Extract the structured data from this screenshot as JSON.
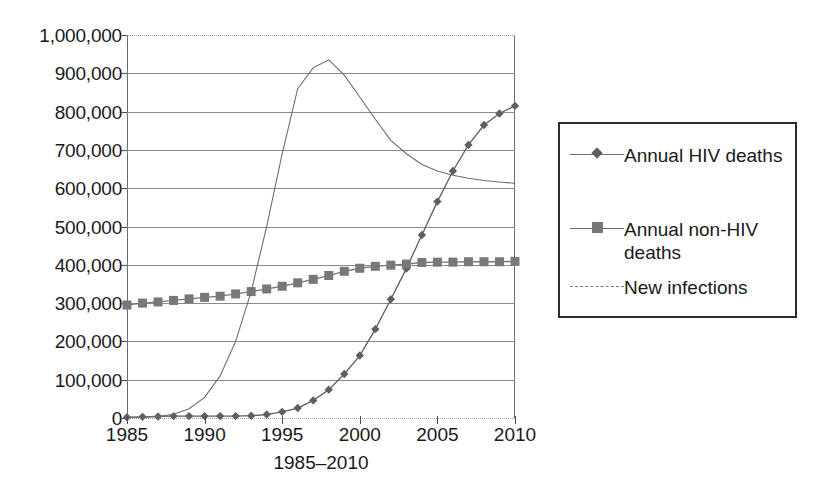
{
  "chart_data": {
    "type": "line",
    "title": "",
    "xlabel": "1985–2010",
    "ylabel": "",
    "xlim": [
      1985,
      2010
    ],
    "ylim": [
      0,
      1000000
    ],
    "grid": true,
    "legend_position": "right",
    "x": [
      1985,
      1986,
      1987,
      1988,
      1989,
      1990,
      1991,
      1992,
      1993,
      1994,
      1995,
      1996,
      1997,
      1998,
      1999,
      2000,
      2001,
      2002,
      2003,
      2004,
      2005,
      2006,
      2007,
      2008,
      2009,
      2010
    ],
    "xtick_labels": [
      "1985",
      "1990",
      "1995",
      "2000",
      "2005",
      "2010"
    ],
    "xticks": [
      1985,
      1990,
      1995,
      2000,
      2005,
      2010
    ],
    "ytick_labels": [
      "0",
      "100,000",
      "200,000",
      "300,000",
      "400,000",
      "500,000",
      "600,000",
      "700,000",
      "800,000",
      "900,000",
      "1,000,000"
    ],
    "yticks": [
      0,
      100000,
      200000,
      300000,
      400000,
      500000,
      600000,
      700000,
      800000,
      900000,
      1000000
    ],
    "series": [
      {
        "name": "Annual HIV deaths",
        "marker": "diamond",
        "color": "#5f5f5f",
        "values": [
          2000,
          3000,
          4000,
          5000,
          5000,
          5000,
          5000,
          5000,
          6000,
          9000,
          16000,
          26000,
          46000,
          74000,
          115000,
          163000,
          232000,
          310000,
          390000,
          478000,
          565000,
          645000,
          713000,
          765000,
          795000,
          815000
        ]
      },
      {
        "name": "Annual non-HIV deaths",
        "marker": "square",
        "color": "#787878",
        "values": [
          295000,
          300000,
          303000,
          307000,
          311000,
          315000,
          318000,
          324000,
          330000,
          337000,
          344000,
          353000,
          362000,
          372000,
          383000,
          391000,
          396000,
          399000,
          402000,
          406000,
          407000,
          407000,
          408000,
          408000,
          408000,
          409000
        ]
      },
      {
        "name": "New infections",
        "marker": "none",
        "color": "#6e6e6e",
        "values": [
          500,
          1500,
          4000,
          10000,
          24000,
          54000,
          110000,
          200000,
          330000,
          500000,
          690000,
          860000,
          915000,
          935000,
          895000,
          838000,
          780000,
          725000,
          690000,
          662000,
          645000,
          634000,
          626000,
          620000,
          616000,
          613000
        ]
      }
    ]
  },
  "legend": {
    "items": [
      {
        "label": "Annual HIV deaths",
        "marker": "diamond"
      },
      {
        "label": "Annual non-HIV deaths",
        "marker": "square"
      },
      {
        "label": "New infections",
        "marker": "none"
      }
    ]
  },
  "axis": {
    "x_title": "1985–2010"
  }
}
